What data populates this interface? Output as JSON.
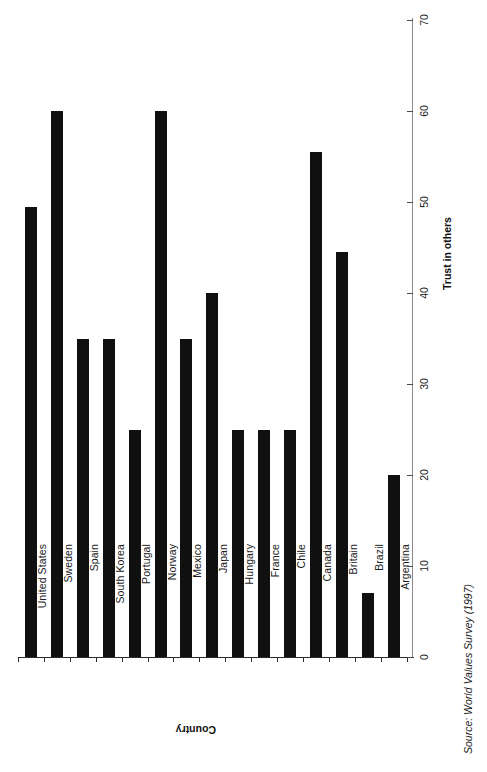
{
  "chart_data": {
    "type": "bar",
    "title": "",
    "subtitle": "",
    "orientation": "vertical",
    "xlabel": "Country",
    "ylabel": "Trust in others",
    "ylim": [
      0,
      70
    ],
    "ytick_step": 10,
    "yticks": [
      "0",
      "10",
      "20",
      "30",
      "40",
      "50",
      "60",
      "70"
    ],
    "grid": false,
    "legend": null,
    "bar_color": "#101010",
    "axis_color": "#8a8a8a",
    "categories": [
      "United States",
      "Sweden",
      "Spain",
      "South Korea",
      "Portugal",
      "Norway",
      "Mexico",
      "Japan",
      "Hungary",
      "France",
      "Chile",
      "Canada",
      "Britain",
      "Brazil",
      "Argentina"
    ],
    "values": [
      49.5,
      60,
      35,
      35,
      25,
      60,
      35,
      40,
      25,
      25,
      25,
      55.5,
      44.5,
      7,
      20
    ],
    "annotations": []
  },
  "source": {
    "text": "Source: World Values Survey (1997)"
  }
}
